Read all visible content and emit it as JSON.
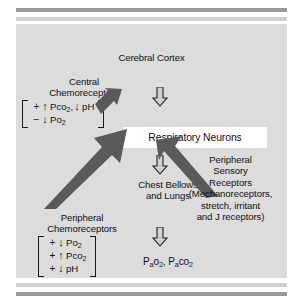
{
  "figure": {
    "colors": {
      "panel_bg": "#dcdcdc",
      "page_bg": "#ffffff",
      "rule_dark": "#9a9a9a",
      "rule_light": "#cfcfcf",
      "arrow_fill": "#5a5a5a",
      "arrow_outline_fill": "#d0d0d0",
      "box_bg": "#ffffff",
      "text": "#111111"
    }
  },
  "nodes": {
    "cerebral_cortex": "Cerebral Cortex",
    "respiratory_neurons": "Respiratory Neurons",
    "chest_bellows": "Chest Bellows\nand Lungs",
    "chest_bellows_line1": "Chest Bellows",
    "chest_bellows_line2": "and Lungs",
    "central_chemoreceptors_line1": "Central",
    "central_chemoreceptors_line2": "Chemoreceptors",
    "peripheral_chemoreceptors_line1": "Peripheral",
    "peripheral_chemoreceptors_line2": "Chemoreceptors",
    "peripheral_sensory_line1": "Peripheral",
    "peripheral_sensory_line2": "Sensory",
    "peripheral_sensory_line3": "Receptors",
    "peripheral_sensory_line4": "(Mechanoreceptors,",
    "peripheral_sensory_line5": "stretch, irritant",
    "peripheral_sensory_line6": "and J receptors)"
  },
  "central_chemoreceptor_stimuli": [
    {
      "sign": "+",
      "direction": "up",
      "arrow": "↑",
      "term": "Pco",
      "sub": "2",
      "trailer": ",",
      "second_direction": "down",
      "second_arrow": "↓",
      "second_term": "pH"
    },
    {
      "sign": "−",
      "direction": "down",
      "arrow": "↓",
      "term": "Po",
      "sub": "2",
      "trailer": "",
      "second_direction": "",
      "second_arrow": "",
      "second_term": ""
    }
  ],
  "peripheral_chemoreceptor_stimuli": [
    {
      "sign": "+",
      "direction": "down",
      "arrow": "↓",
      "term": "Po",
      "sub": "2"
    },
    {
      "sign": "+",
      "direction": "up",
      "arrow": "↑",
      "term": "Pco",
      "sub": "2"
    },
    {
      "sign": "+",
      "direction": "down",
      "arrow": "↓",
      "term": "pH",
      "sub": ""
    }
  ],
  "output": {
    "label_p1": "P",
    "label_sub1": "a",
    "label_o2": "o",
    "label_o2_sub": "2",
    "separator": ", ",
    "label_p2": "P",
    "label_sub2": "a",
    "label_co2": "co",
    "label_co2_sub": "2",
    "full": "Pao2, Paco2"
  },
  "icons": {
    "arrow_down_cortex": "arrow-down-icon",
    "arrow_down_chest": "arrow-down-icon",
    "arrow_down_output": "arrow-down-icon",
    "arrow_central_input": "block-arrow-up-right-icon",
    "arrow_peripheral_input": "block-arrow-up-right-icon",
    "arrow_sensory_input": "block-arrow-up-left-icon"
  }
}
